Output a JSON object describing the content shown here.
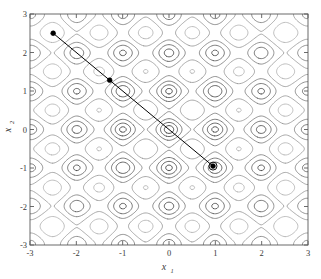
{
  "figure": {
    "name": "rastrigin-contour-with-optimization-path",
    "background_color": "#ffffff"
  },
  "chart_data": {
    "type": "line",
    "title": "",
    "subtitle": "",
    "xlabel": "x",
    "xlabel_sub": "1",
    "ylabel": "x",
    "ylabel_sub": "2",
    "xlim": [
      -3,
      3
    ],
    "ylim": [
      -3,
      3
    ],
    "xticks": [
      -3,
      -2,
      -1,
      0,
      1,
      2,
      3
    ],
    "yticks": [
      -3,
      -2,
      -1,
      0,
      1,
      2,
      3
    ],
    "xticklabels": [
      "-3",
      "-2",
      "-1",
      "0",
      "1",
      "2",
      "3"
    ],
    "yticklabels": [
      "-3",
      "-2",
      "-1",
      "0",
      "1",
      "2",
      "3"
    ],
    "grid": false,
    "legend": "none",
    "box": true,
    "background_field": {
      "description": "contour map of the Rastrigin function on [-3,3]x[-3,3]",
      "function": "f(x1,x2) = 20 + x1^2 + x2^2 - 10*cos(2*pi*x1) - 10*cos(2*pi*x2)",
      "minima_lattice_spacing": 1,
      "global_minimum": [
        0,
        0
      ],
      "contour_levels": [
        2,
        6,
        12,
        20,
        30,
        42,
        56,
        72,
        90
      ],
      "contour_colors": [
        "#1c1c1c",
        "#343434",
        "#4f4f4f",
        "#6d6d6d",
        "#8c8c8c",
        "#a9a9a9",
        "#bfbfbf",
        "#d2d2d2",
        "#e2e2e2"
      ]
    },
    "series": [
      {
        "name": "optimization path",
        "color": "#000000",
        "linewidth": 1,
        "marker": "filled-dot",
        "x": [
          -2.5,
          -1.28,
          0.95
        ],
        "y": [
          2.5,
          1.28,
          -0.95
        ],
        "point_labels": [
          "start",
          "iterate-1",
          "final"
        ],
        "final_point_marker": "circle-outline"
      }
    ]
  }
}
